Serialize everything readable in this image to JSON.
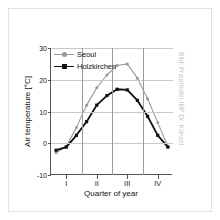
{
  "figure": {
    "background_color": "#ffffff",
    "border_color": "#e2e2e2"
  },
  "credit": {
    "text": "Bild: Fraunhofer IBP Dr. Künzel",
    "color": "#c4c4c4"
  },
  "chart_data": {
    "type": "line",
    "title": "",
    "subtitle": "",
    "xlabel": "Quarter of year",
    "ylabel": "Air temperature [°C]",
    "ylim": [
      -10,
      30
    ],
    "yticks": [
      -10,
      0,
      10,
      20,
      30
    ],
    "ytick_labels": [
      "-10",
      "0",
      "10",
      "20",
      "30"
    ],
    "xlim": [
      0,
      12
    ],
    "xticks": [
      1.5,
      4.5,
      7.5,
      10.5
    ],
    "xtick_labels": [
      "I",
      "II",
      "III",
      "IV"
    ],
    "x_gridlines": [
      3,
      6,
      9
    ],
    "grid": "horizontal-and-quarter-dividers",
    "legend_position": "upper-left-inside",
    "x": [
      0.5,
      1.5,
      2.5,
      3.5,
      4.5,
      5.5,
      6.5,
      7.5,
      8.5,
      9.5,
      10.5,
      11.5
    ],
    "series": [
      {
        "name": "Seoul",
        "color": "#9a9a9a",
        "marker": "circle",
        "values": [
          -3.0,
          -1.0,
          5.0,
          12.0,
          17.5,
          21.5,
          24.5,
          25.0,
          20.5,
          14.0,
          6.5,
          -1.0
        ]
      },
      {
        "name": "Holzkirchen",
        "color": "#111111",
        "marker": "square",
        "values": [
          -2.2,
          -1.2,
          2.5,
          6.8,
          12.0,
          15.0,
          17.0,
          16.8,
          13.5,
          8.5,
          2.5,
          -1.2
        ]
      }
    ]
  },
  "legend": {
    "items": [
      {
        "label": "Seoul",
        "color": "#9a9a9a",
        "marker": "circle"
      },
      {
        "label": "Holzkirchen",
        "color": "#111111",
        "marker": "square"
      }
    ]
  }
}
